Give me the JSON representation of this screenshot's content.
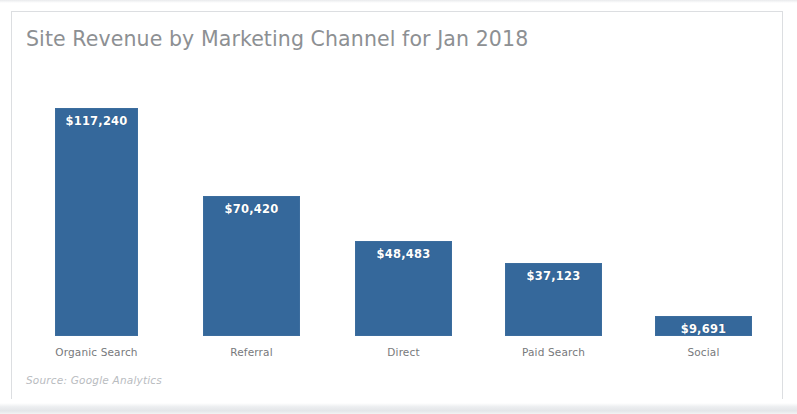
{
  "figure": {
    "title": "Site Revenue by Marketing Channel for Jan 2018",
    "source_note": "Source: Google Analytics",
    "background_color": "#ffffff",
    "frame_color": "#dcdee1",
    "title_color": "#8d9093",
    "label_color": "#77797c",
    "source_color": "#b9bcbf"
  },
  "chart_data": {
    "type": "bar",
    "title": "Site Revenue by Marketing Channel for Jan 2018",
    "xlabel": "",
    "ylabel": "",
    "categories": [
      "Organic Search",
      "Referral",
      "Direct",
      "Paid Search",
      "Social"
    ],
    "values": [
      117240,
      70420,
      48483,
      37123,
      9691
    ],
    "value_labels": [
      "$117,240",
      "$70,420",
      "$48,483",
      "$37,123",
      "$9,691"
    ],
    "series": [
      {
        "name": "Site Revenue",
        "values": [
          117240,
          70420,
          48483,
          37123,
          9691
        ],
        "color": "#35689b"
      }
    ],
    "ylim": [
      0,
      117240
    ],
    "grid": false,
    "legend": "none",
    "axis_visible": false,
    "value_label_position": "inside-top",
    "currency": "USD",
    "annotations": [
      "Source: Google Analytics"
    ]
  },
  "bars": [
    {
      "label": "Organic Search",
      "value_label": "$117,240",
      "value": 117240,
      "left": 55,
      "width": 83,
      "top": 108,
      "height": 228,
      "label_left": 23,
      "label_width": 147
    },
    {
      "label": "Referral",
      "value_label": "$70,420",
      "value": 70420,
      "left": 203,
      "width": 97,
      "top": 196,
      "height": 140,
      "label_left": 178,
      "label_width": 147
    },
    {
      "label": "Direct",
      "value_label": "$48,483",
      "value": 48483,
      "left": 355,
      "width": 97,
      "top": 241,
      "height": 95,
      "label_left": 330,
      "label_width": 147
    },
    {
      "label": "Paid Search",
      "value_label": "$37,123",
      "value": 37123,
      "left": 505,
      "width": 97,
      "top": 263,
      "height": 73,
      "label_left": 480,
      "label_width": 147
    },
    {
      "label": "Social",
      "value_label": "$9,691",
      "value": 9691,
      "left": 655,
      "width": 97,
      "top": 316,
      "height": 20,
      "label_left": 630,
      "label_width": 147
    }
  ],
  "layout": {
    "baseline_y": 336,
    "category_label_y": 346
  }
}
